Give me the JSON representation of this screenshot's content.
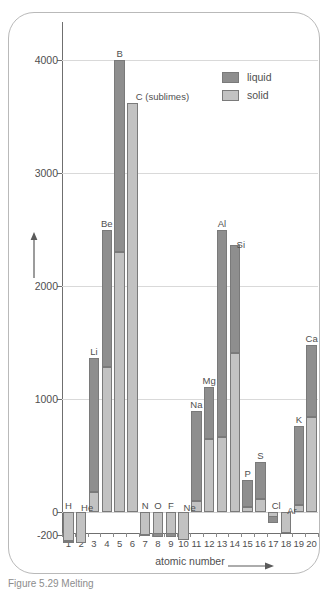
{
  "figure": {
    "caption": "Figure 5.29  Melting",
    "frame_color": "#b9b9b9"
  },
  "legend": {
    "position": "top-right",
    "items": [
      {
        "label": "liquid",
        "color": "#8e8e8e",
        "name": "liquid-swatch"
      },
      {
        "label": "solid",
        "color": "#c2c2c2",
        "name": "solid-swatch"
      }
    ]
  },
  "axes": {
    "y_title": "temperature/°C",
    "x_title": "atomic number",
    "y_ticks": [
      "4000",
      "3000",
      "2000",
      "1000",
      "0",
      "-200"
    ],
    "y_tick_values": [
      4000,
      3000,
      2000,
      1000,
      0,
      -200
    ],
    "x_ticks": [
      "1",
      "2",
      "3",
      "4",
      "5",
      "6",
      "7",
      "8",
      "9",
      "10",
      "11",
      "12",
      "13",
      "14",
      "15",
      "16",
      "17",
      "18",
      "19",
      "20"
    ]
  },
  "chart_data": {
    "type": "bar",
    "title": "",
    "subtitle": "",
    "xlabel": "atomic number",
    "ylabel": "temperature/°C",
    "ylim": [
      -280,
      4250
    ],
    "xlim": [
      0.5,
      20.5
    ],
    "grid": true,
    "legend_position": "top-right",
    "categories": [
      "1",
      "2",
      "3",
      "4",
      "5",
      "6",
      "7",
      "8",
      "9",
      "10",
      "11",
      "12",
      "13",
      "14",
      "15",
      "16",
      "17",
      "18",
      "19",
      "20"
    ],
    "element_symbols": [
      "H",
      "He",
      "Li",
      "Be",
      "B",
      "C",
      "N",
      "O",
      "F",
      "Ne",
      "Na",
      "Mg",
      "Al",
      "Si",
      "P",
      "S",
      "Cl",
      "Ar",
      "K",
      "Ca"
    ],
    "series": [
      {
        "name": "solid",
        "description": "melting point (bottom of stack, light grey)",
        "color": "#c2c2c2",
        "values": [
          -259,
          -272,
          180,
          1280,
          2300,
          3620,
          -210,
          -219,
          -220,
          -249,
          98,
          650,
          660,
          1410,
          44,
          119,
          -101,
          -189,
          63,
          840
        ]
      },
      {
        "name": "liquid",
        "description": "boiling point (top of stack, dark grey)",
        "color": "#8e8e8e",
        "values": [
          -253,
          -269,
          1360,
          2500,
          4000,
          3620,
          -196,
          -183,
          -188,
          -246,
          890,
          1110,
          2500,
          2360,
          280,
          445,
          -35,
          -186,
          760,
          1480
        ]
      }
    ],
    "annotations": [
      {
        "label": "H",
        "atomic_number": 1
      },
      {
        "label": "He",
        "atomic_number": 2
      },
      {
        "label": "Li",
        "atomic_number": 3
      },
      {
        "label": "Be",
        "atomic_number": 4
      },
      {
        "label": "B",
        "atomic_number": 5
      },
      {
        "label": "C (sublimes)",
        "atomic_number": 6
      },
      {
        "label": "N",
        "atomic_number": 7
      },
      {
        "label": "O",
        "atomic_number": 8
      },
      {
        "label": "F",
        "atomic_number": 9
      },
      {
        "label": "Ne",
        "atomic_number": 10
      },
      {
        "label": "Na",
        "atomic_number": 11
      },
      {
        "label": "Mg",
        "atomic_number": 12
      },
      {
        "label": "Al",
        "atomic_number": 13
      },
      {
        "label": "Si",
        "atomic_number": 14
      },
      {
        "label": "P",
        "atomic_number": 15
      },
      {
        "label": "S",
        "atomic_number": 16
      },
      {
        "label": "Cl",
        "atomic_number": 17
      },
      {
        "label": "Ar",
        "atomic_number": 18
      },
      {
        "label": "K",
        "atomic_number": 19
      },
      {
        "label": "Ca",
        "atomic_number": 20
      }
    ]
  }
}
